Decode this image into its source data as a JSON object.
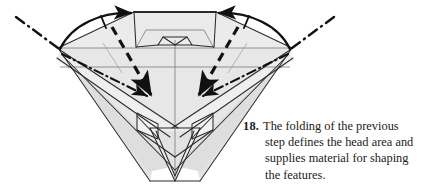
{
  "figure": {
    "type": "origami-folding-diagram",
    "step_number": "18.",
    "caption_lines": [
      "The folding of the previous",
      "step defines the head area and",
      "supplies material for shaping",
      "the features."
    ],
    "caption_full": "18. The folding of the previous step defines the head area and supplies material for shaping the features."
  },
  "colors": {
    "background": "#ffffff",
    "paper_fill_light": "#ebebeb",
    "paper_fill_mid": "#e0e0e0",
    "paper_fill_dark": "#d4d4d4",
    "paper_fill_white": "#f7f7f7",
    "outline": "#2b2b2b",
    "thin_line": "#58585a",
    "fold_arrow": "#111111",
    "text": "#1c1a18"
  },
  "annotations": {
    "valley_fold_arrows": 2,
    "mountain_fold_arrows": 2,
    "dash_dot_axis_lines": 2,
    "rotation_arcs": 2,
    "tick_marks": 2
  }
}
